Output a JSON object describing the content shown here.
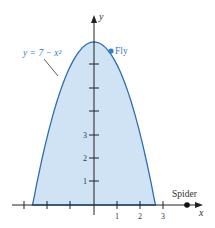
{
  "chart_data": {
    "type": "area",
    "title": "",
    "equation_label": "y = 7 − x²",
    "xlabel": "x",
    "ylabel": "y",
    "x_ticks": [
      -3,
      -2,
      -1,
      0,
      1,
      2,
      3
    ],
    "x_tick_labels": [
      "1",
      "2",
      "3"
    ],
    "y_ticks": [
      1,
      2,
      3,
      4,
      5,
      6
    ],
    "y_tick_labels": [
      "1",
      "2",
      "3"
    ],
    "xlim": [
      -4,
      4.6
    ],
    "ylim": [
      0,
      7.6
    ],
    "series": [
      {
        "name": "y = 7 − x²",
        "function": "7 - x^2",
        "x_range": [
          -2.65,
          2.65
        ],
        "fill": "#cfe3f5",
        "stroke": "#2f6fb0"
      }
    ],
    "points": [
      {
        "name": "Fly",
        "x": 0.75,
        "y": 6.4,
        "color": "#2f7fd0"
      },
      {
        "name": "Spider",
        "x": 4,
        "y": 0,
        "color": "#111111"
      }
    ],
    "grid": false,
    "legend": "none"
  },
  "labels": {
    "equation": "y = 7 − x²",
    "fly": "Fly",
    "spider": "Spider",
    "x_axis": "x",
    "y_axis": "y",
    "xt1": "1",
    "xt2": "2",
    "xt3": "3",
    "yt1": "1",
    "yt2": "2",
    "yt3": "3"
  }
}
